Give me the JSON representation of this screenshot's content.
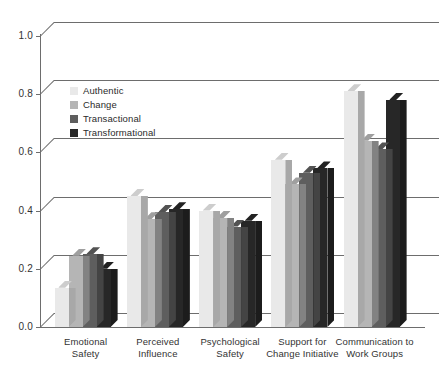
{
  "chart_data": {
    "type": "bar",
    "title": "",
    "xlabel": "",
    "ylabel": "",
    "ylim": [
      0.0,
      1.0
    ],
    "ytick_labels": [
      "0.0",
      "0.2",
      "0.4",
      "0.6",
      "0.8",
      "1.0"
    ],
    "ytick_values": [
      0.0,
      0.2,
      0.4,
      0.6,
      0.8,
      1.0
    ],
    "grid": true,
    "legend_position": "upper-left-inside",
    "style": "3d-grouped-bar",
    "categories": [
      "Emotional Safety",
      "Perceived Influence",
      "Psychological Safety",
      "Support for Change Initiative",
      "Communication to Work Groups"
    ],
    "category_lines": [
      [
        "Emotional",
        "Safety"
      ],
      [
        "Perceived",
        "Influence"
      ],
      [
        "Psychological",
        "Safety"
      ],
      [
        "Support for",
        "Change Initiative"
      ],
      [
        "Communication to",
        "Work Groups"
      ]
    ],
    "series": [
      {
        "name": "Authentic",
        "color": "#e9e9e9",
        "values": [
          0.135,
          0.45,
          0.4,
          0.575,
          0.81
        ]
      },
      {
        "name": "Change",
        "color": "#b5b5b5",
        "values": [
          0.245,
          0.37,
          0.375,
          0.49,
          0.64
        ]
      },
      {
        "name": "Transactional",
        "color": "#5e5e5e",
        "values": [
          0.25,
          0.395,
          0.345,
          0.53,
          0.61
        ]
      },
      {
        "name": "Transformational",
        "color": "#272727",
        "values": [
          0.2,
          0.405,
          0.365,
          0.545,
          0.78
        ]
      }
    ]
  },
  "legend": {
    "items": [
      {
        "label": "Authentic"
      },
      {
        "label": "Change"
      },
      {
        "label": "Transactional"
      },
      {
        "label": "Transformational"
      }
    ]
  }
}
